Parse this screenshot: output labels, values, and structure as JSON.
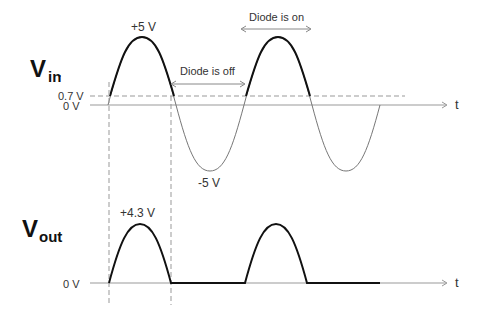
{
  "diagram": {
    "vin": {
      "label_main": "V",
      "label_sub": "in",
      "label_dot": ".",
      "peak_label": "+5 V",
      "trough_label": "-5 V",
      "threshold_label": "0.7 V",
      "zero_label": "0 V",
      "axis_label": "t"
    },
    "vout": {
      "label_main": "V",
      "label_sub": "out",
      "peak_label": "+4.3 V",
      "zero_label": "0 V",
      "axis_label": "t"
    },
    "annotations": {
      "diode_off": "Diode is off",
      "diode_on": "Diode is on"
    },
    "colors": {
      "waveform_bold": "#111111",
      "waveform_thin": "#777777",
      "axis": "#999999",
      "dashed": "#999999",
      "text": "#333333"
    }
  }
}
